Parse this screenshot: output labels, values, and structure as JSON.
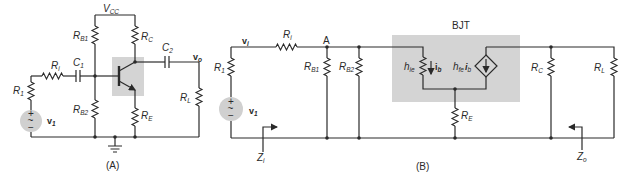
{
  "figure": {
    "panel_a": {
      "caption": "(A)",
      "labels": {
        "vcc": "V",
        "vcc_sub": "CC",
        "rb1": "R",
        "rb1_sub": "B1",
        "rc": "R",
        "rc_sub": "C",
        "c2": "C",
        "c2_sub": "2",
        "vo": "v",
        "vo_sub": "o",
        "ri": "R",
        "ri_sub": "i",
        "c1": "C",
        "c1_sub": "1",
        "r1": "R",
        "r1_sub": "1",
        "rl": "R",
        "rl_sub": "L",
        "rb2": "R",
        "rb2_sub": "B2",
        "re": "R",
        "re_sub": "E",
        "v1": "v",
        "v1_sub": "1",
        "plus": "+",
        "minus": "−",
        "tilde": "~"
      }
    },
    "panel_b": {
      "caption": "(B)",
      "box_title": "BJT",
      "labels": {
        "vi": "v",
        "vi_sub": "i",
        "ri": "R",
        "ri_sub": "i",
        "node_a": "A",
        "r1": "R",
        "r1_sub": "1",
        "rb1": "R",
        "rb1_sub": "B1",
        "rb2": "R",
        "rb2_sub": "B2",
        "hie": "h",
        "hie_sub": "ie",
        "ib": "i",
        "ib_sub": "b",
        "hfe": "h",
        "hfe_sub": "fe",
        "hfe_ib": "i",
        "hfe_ib_sub": "b",
        "re": "R",
        "re_sub": "E",
        "rc": "R",
        "rc_sub": "C",
        "rl": "R",
        "rl_sub": "L",
        "v1": "v",
        "v1_sub": "1",
        "zi": "Z",
        "zi_sub": "i",
        "zo": "Z",
        "zo_sub": "o",
        "plus": "+",
        "minus": "−",
        "tilde": "~"
      }
    },
    "colors": {
      "wire": "#2a2a2a",
      "shade": "#d4d4d4",
      "source_fill": "#d0d0d0"
    }
  }
}
